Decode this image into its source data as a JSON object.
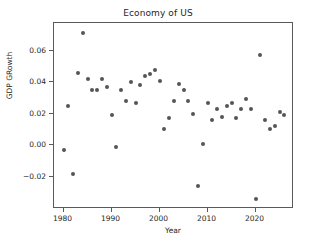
{
  "chart_data": {
    "type": "scatter",
    "title": "Economy of US",
    "xlabel": "Year",
    "ylabel": "GDP GRowth",
    "grid": false,
    "legend": null,
    "xlim": [
      1978.0,
      1987.6
    ],
    "ylim": [
      -0.0405,
      0.0775
    ],
    "xticks": [
      1980,
      1990,
      2000,
      2010,
      2020
    ],
    "xtick_labels": [
      "1980",
      "1990",
      "2000",
      "2010",
      "2020"
    ],
    "yticks": [
      -0.02,
      0.0,
      0.02,
      0.04,
      0.06
    ],
    "ytick_labels": [
      "−0.02",
      "0.00",
      "0.02",
      "0.04",
      "0.06"
    ],
    "marker_color": "#555555",
    "marker_size": 4,
    "x": [
      1980,
      1981,
      1982,
      1983,
      1984,
      1985,
      1986,
      1987,
      1988,
      1989,
      1990,
      1991,
      1992,
      1993,
      1994,
      1995,
      1996,
      1997,
      1998,
      1999,
      2000,
      2001,
      2002,
      2003,
      2004,
      2005,
      2006,
      2007,
      2008,
      2009,
      2010,
      2011,
      2012,
      2013,
      2014,
      2015,
      2016,
      2017,
      2018,
      2019,
      2020,
      2021,
      2022,
      2023,
      2024,
      2025,
      2026
    ],
    "y": [
      -0.003,
      0.025,
      -0.018,
      0.046,
      0.071,
      0.042,
      0.035,
      0.035,
      0.042,
      0.037,
      0.019,
      -0.001,
      0.035,
      0.028,
      0.04,
      0.027,
      0.038,
      0.044,
      0.045,
      0.048,
      0.041,
      0.01,
      0.017,
      0.028,
      0.039,
      0.035,
      0.028,
      0.02,
      -0.026,
      0.001,
      0.027,
      0.016,
      0.023,
      0.018,
      0.025,
      0.027,
      0.017,
      0.023,
      0.029,
      0.023,
      -0.034,
      0.057,
      0.016,
      0.01,
      0.012,
      0.021,
      0.019
    ],
    "points": [
      {
        "year": 1980,
        "growth": -0.003
      },
      {
        "year": 1981,
        "growth": 0.025
      },
      {
        "year": 1982,
        "growth": -0.018
      },
      {
        "year": 1983,
        "growth": 0.046
      },
      {
        "year": 1984,
        "growth": 0.071
      },
      {
        "year": 1985,
        "growth": 0.042
      },
      {
        "year": 1986,
        "growth": 0.035
      },
      {
        "year": 1987,
        "growth": 0.035
      },
      {
        "year": 1988,
        "growth": 0.042
      },
      {
        "year": 1989,
        "growth": 0.037
      },
      {
        "year": 1990,
        "growth": 0.019
      },
      {
        "year": 1991,
        "growth": -0.001
      },
      {
        "year": 1992,
        "growth": 0.035
      },
      {
        "year": 1993,
        "growth": 0.028
      },
      {
        "year": 1994,
        "growth": 0.04
      },
      {
        "year": 1995,
        "growth": 0.027
      },
      {
        "year": 1996,
        "growth": 0.038
      },
      {
        "year": 1997,
        "growth": 0.044
      },
      {
        "year": 1998,
        "growth": 0.045
      },
      {
        "year": 1999,
        "growth": 0.048
      },
      {
        "year": 2000,
        "growth": 0.041
      },
      {
        "year": 2001,
        "growth": 0.01
      },
      {
        "year": 2002,
        "growth": 0.017
      },
      {
        "year": 2003,
        "growth": 0.028
      },
      {
        "year": 2004,
        "growth": 0.039
      },
      {
        "year": 2005,
        "growth": 0.035
      },
      {
        "year": 2006,
        "growth": 0.028
      },
      {
        "year": 2007,
        "growth": 0.02
      },
      {
        "year": 2008,
        "growth": -0.026
      },
      {
        "year": 2009,
        "growth": 0.001
      },
      {
        "year": 2010,
        "growth": 0.027
      },
      {
        "year": 2011,
        "growth": 0.016
      },
      {
        "year": 2012,
        "growth": 0.023
      },
      {
        "year": 2013,
        "growth": 0.018
      },
      {
        "year": 2014,
        "growth": 0.025
      },
      {
        "year": 2015,
        "growth": 0.027
      },
      {
        "year": 2016,
        "growth": 0.017
      },
      {
        "year": 2017,
        "growth": 0.023
      },
      {
        "year": 2018,
        "growth": 0.029
      },
      {
        "year": 2019,
        "growth": 0.023
      },
      {
        "year": 2020,
        "growth": -0.034
      },
      {
        "year": 2021,
        "growth": 0.057
      },
      {
        "year": 2022,
        "growth": 0.016
      },
      {
        "year": 2023,
        "growth": 0.01
      },
      {
        "year": 2024,
        "growth": 0.012
      },
      {
        "year": 2025,
        "growth": 0.021
      },
      {
        "year": 2026,
        "growth": 0.019
      }
    ]
  }
}
